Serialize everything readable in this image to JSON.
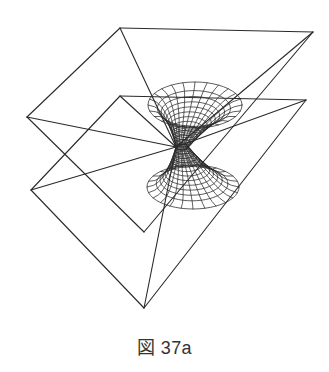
{
  "caption": "図 37a",
  "figure": {
    "stroke_color": "#2a2a2a",
    "vertices": {
      "upper_top": [
        120,
        28
      ],
      "upper_right": [
        313,
        32
      ],
      "upper_left": [
        27,
        117
      ],
      "lower_top": [
        120,
        96
      ],
      "lower_right": [
        306,
        100
      ],
      "lower_left": [
        31,
        190
      ],
      "inner_bottom": [
        144,
        232
      ],
      "bottom": [
        144,
        308
      ],
      "apex": [
        176,
        147
      ]
    },
    "edges": [
      [
        "upper_top",
        "upper_right"
      ],
      [
        "upper_top",
        "upper_left"
      ],
      [
        "upper_top",
        "apex"
      ],
      [
        "upper_left",
        "apex"
      ],
      [
        "upper_left",
        "inner_bottom"
      ],
      [
        "upper_right",
        "inner_bottom"
      ],
      [
        "upper_right",
        "apex"
      ],
      [
        "lower_top",
        "lower_right"
      ],
      [
        "lower_top",
        "lower_left"
      ],
      [
        "lower_top",
        "apex"
      ],
      [
        "lower_left",
        "apex"
      ],
      [
        "lower_left",
        "bottom"
      ],
      [
        "lower_right",
        "bottom"
      ],
      [
        "lower_right",
        "apex"
      ],
      [
        "bottom",
        "apex"
      ]
    ],
    "hourglass": {
      "top_rim": {
        "cx": 195,
        "cy": 105,
        "rx": 47,
        "ry": 23
      },
      "waist": {
        "cx": 182,
        "cy": 147,
        "rx": 6,
        "ry": 3
      },
      "bottom_rim": {
        "cx": 193,
        "cy": 187,
        "rx": 46,
        "ry": 22
      },
      "rings_per_half": 12,
      "meridians": 24
    }
  }
}
